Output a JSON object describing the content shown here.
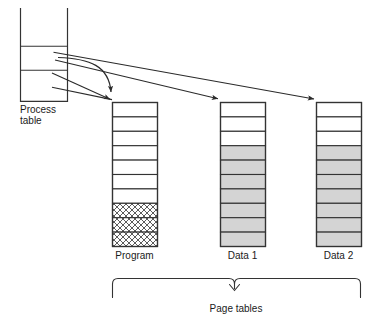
{
  "diagram": {
    "title_labels": {
      "process_table": "Process\ntable",
      "process_table_line1": "Process",
      "process_table_line2": "table",
      "page_tables": "Page tables"
    },
    "colors": {
      "stroke": "#333333",
      "cell_gray": "#d4d4d4",
      "cell_white": "#ffffff",
      "hatch": "#555555",
      "background": "#ffffff",
      "text": "#1a1a1a"
    },
    "process_table": {
      "name": "Process table",
      "x": 20,
      "y": 8,
      "width": 48,
      "height": 94,
      "open_top": true,
      "divider_offsets": [
        38,
        62,
        94
      ]
    },
    "page_tables": [
      {
        "id": "program",
        "label": "Program",
        "x": 112,
        "y": 102,
        "width": 45,
        "row_height": 14.4,
        "rows": [
          {
            "fill": "white"
          },
          {
            "fill": "white"
          },
          {
            "fill": "white"
          },
          {
            "fill": "white"
          },
          {
            "fill": "white"
          },
          {
            "fill": "white"
          },
          {
            "fill": "white"
          },
          {
            "fill": "hatch"
          },
          {
            "fill": "hatch"
          },
          {
            "fill": "hatch"
          }
        ]
      },
      {
        "id": "data1",
        "label": "Data 1",
        "x": 220,
        "y": 102,
        "width": 45,
        "row_height": 14.4,
        "rows": [
          {
            "fill": "white"
          },
          {
            "fill": "white"
          },
          {
            "fill": "white"
          },
          {
            "fill": "gray"
          },
          {
            "fill": "gray"
          },
          {
            "fill": "gray"
          },
          {
            "fill": "gray"
          },
          {
            "fill": "gray"
          },
          {
            "fill": "gray"
          },
          {
            "fill": "gray"
          }
        ]
      },
      {
        "id": "data2",
        "label": "Data 2",
        "x": 316,
        "y": 102,
        "width": 45,
        "row_height": 14.4,
        "rows": [
          {
            "fill": "white"
          },
          {
            "fill": "white"
          },
          {
            "fill": "white"
          },
          {
            "fill": "gray"
          },
          {
            "fill": "gray"
          },
          {
            "fill": "gray"
          },
          {
            "fill": "gray"
          },
          {
            "fill": "gray"
          },
          {
            "fill": "gray"
          },
          {
            "fill": "gray"
          }
        ]
      }
    ],
    "pointers": [
      {
        "id": "ptr-curved-program",
        "from": "process-table-row-2",
        "to": "program",
        "style": "curved"
      },
      {
        "id": "ptr-program",
        "from": "process-table-row-4",
        "to": "program",
        "style": "straight"
      },
      {
        "id": "ptr-data1",
        "from": "process-table-row-3",
        "to": "data1",
        "style": "straight"
      },
      {
        "id": "ptr-data2",
        "from": "process-table-row-2",
        "to": "data2",
        "style": "straight"
      }
    ],
    "brace": {
      "label": "Page tables",
      "x_start": 112,
      "x_end": 361,
      "y": 278
    }
  }
}
